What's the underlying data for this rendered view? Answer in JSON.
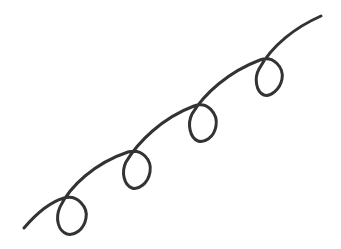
{
  "drawing": {
    "description": "Curly looped line with four loops rising from lower-left to upper-right",
    "stroke_color": "#333333",
    "background_color": "#ffffff",
    "stroke_width": 3,
    "loop_count": 4
  }
}
